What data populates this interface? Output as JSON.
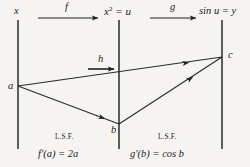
{
  "figure": {
    "kind": "commutative-mapping-diagram",
    "background_color": "#f6f4f1",
    "ink_color": "#1f1f1f"
  },
  "axes": [
    {
      "id": "domain-x",
      "label_main": "x",
      "label_sup": "",
      "label_rest": "",
      "x": 18,
      "top": 20,
      "bottom": 149
    },
    {
      "id": "domain-u",
      "label_main": "x",
      "label_sup": "2",
      "label_rest": " = u",
      "x": 119,
      "top": 20,
      "bottom": 149
    },
    {
      "id": "codomain-y",
      "label_main": "sin u",
      "label_sup": "",
      "label_rest": " = y",
      "x": 222,
      "top": 20,
      "bottom": 149
    }
  ],
  "axis_labels": {
    "left": "x",
    "middle_base": "x",
    "middle_exponent": "2",
    "middle_tail": " = u",
    "right": "sin u = y"
  },
  "map_arrows": [
    {
      "id": "f",
      "label": "f",
      "x1": 38,
      "y1": 18,
      "x2": 98,
      "y2": 18
    },
    {
      "id": "g",
      "label": "g",
      "x1": 150,
      "y1": 18,
      "x2": 196,
      "y2": 18
    },
    {
      "id": "h",
      "label": "h",
      "x1": 88,
      "y1": 69,
      "x2": 114,
      "y2": 69
    }
  ],
  "points": [
    {
      "id": "a",
      "label": "a",
      "x": 18,
      "y": 86
    },
    {
      "id": "b",
      "label": "b",
      "x": 119,
      "y": 124
    },
    {
      "id": "c",
      "label": "c",
      "x": 222,
      "y": 57
    }
  ],
  "segments": [
    {
      "id": "a-to-c",
      "from": "a",
      "to": "c",
      "arrow_at": 0.84
    },
    {
      "id": "a-to-b",
      "from": "a",
      "to": "b",
      "arrow_at": 0.86
    },
    {
      "id": "b-to-c",
      "from": "b",
      "to": "c",
      "arrow_at": 0.72
    }
  ],
  "annotations": [
    {
      "id": "left-lsf",
      "heading": "L.S.F.",
      "formula_prefix": "f",
      "formula_prime": "′",
      "formula_body": "(a) = 2a",
      "full_formula": "f′(a) = 2a",
      "x": 69,
      "heading_y": 139,
      "formula_y": 157
    },
    {
      "id": "right-lsf",
      "heading": "L.S.F.",
      "formula_prefix": "g",
      "formula_prime": "′",
      "formula_body": "(b) = cos b",
      "full_formula": "g′(b) = cos b",
      "x": 172,
      "heading_y": 139,
      "formula_y": 157
    }
  ]
}
